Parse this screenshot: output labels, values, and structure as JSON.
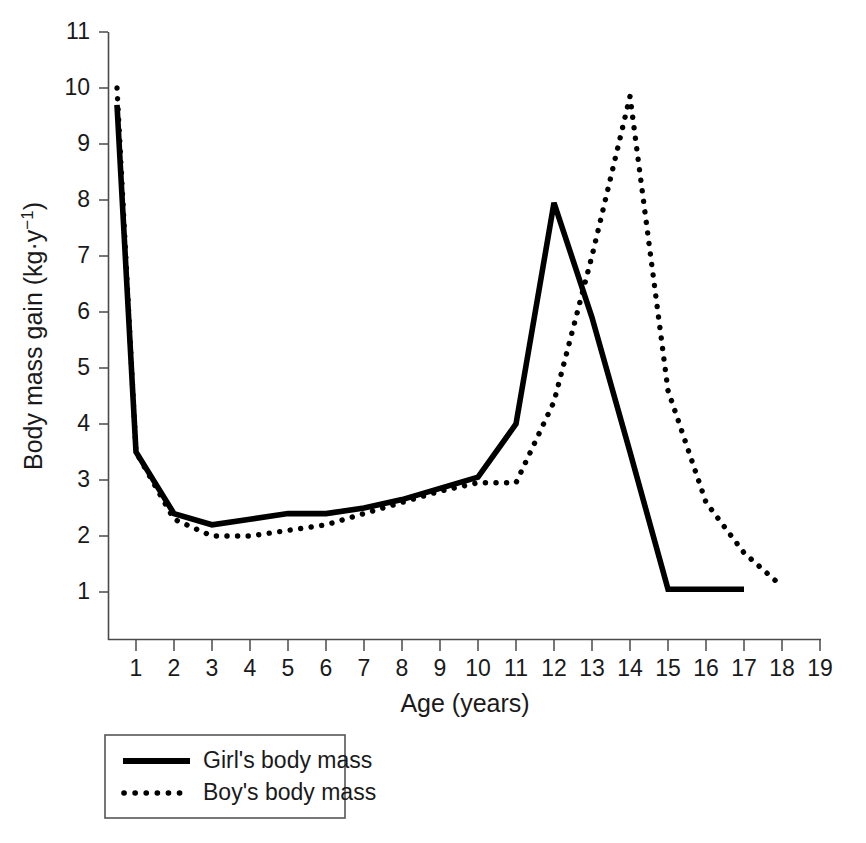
{
  "chart_data": {
    "type": "line",
    "title": "",
    "xlabel": "Age (years)",
    "ylabel": "Body mass gain (kg·y⁻¹)",
    "xlim": [
      0,
      19
    ],
    "ylim": [
      0,
      11
    ],
    "xticks": [
      1,
      2,
      3,
      4,
      5,
      6,
      7,
      8,
      9,
      10,
      11,
      12,
      13,
      14,
      15,
      16,
      17,
      18,
      19
    ],
    "yticks": [
      1,
      2,
      3,
      4,
      5,
      6,
      7,
      8,
      9,
      10,
      11
    ],
    "grid": false,
    "legend_position": "below-left",
    "series": [
      {
        "name": "Girl's body mass",
        "style": "solid",
        "color": "#000000",
        "x": [
          0.5,
          1,
          2,
          3,
          4,
          5,
          6,
          7,
          8,
          9,
          10,
          11,
          12,
          13,
          14,
          15,
          16,
          17
        ],
        "values": [
          9.7,
          3.5,
          2.4,
          2.2,
          2.3,
          2.4,
          2.4,
          2.5,
          2.65,
          2.85,
          3.05,
          4.0,
          7.95,
          5.9,
          3.5,
          1.05,
          1.05,
          1.05
        ]
      },
      {
        "name": "Boy's body mass",
        "style": "dotted",
        "color": "#000000",
        "x": [
          0.5,
          1,
          2,
          3,
          4,
          5,
          6,
          7,
          8,
          9,
          10,
          11,
          12,
          13,
          14,
          15,
          16,
          17,
          18
        ],
        "values": [
          10.0,
          3.5,
          2.3,
          2.0,
          2.0,
          2.1,
          2.2,
          2.4,
          2.6,
          2.8,
          2.95,
          2.95,
          4.4,
          7.0,
          9.85,
          4.6,
          2.6,
          1.7,
          1.1
        ]
      }
    ],
    "legend_entries": [
      {
        "label": "Girl's body mass",
        "style": "solid"
      },
      {
        "label": "Boy's body mass",
        "style": "dotted"
      }
    ]
  }
}
